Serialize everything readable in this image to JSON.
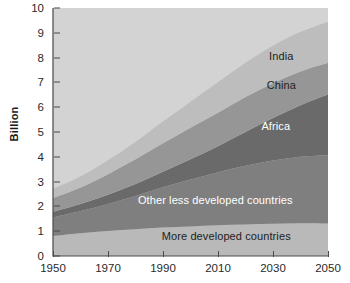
{
  "chart_data": {
    "type": "area",
    "stacked": true,
    "title": "",
    "xlabel": "",
    "ylabel": "Billion",
    "x": [
      1950,
      1960,
      1970,
      1980,
      1990,
      2000,
      2010,
      2020,
      2030,
      2040,
      2050
    ],
    "xlim": [
      1950,
      2050
    ],
    "ylim": [
      0,
      10
    ],
    "xticks": [
      1950,
      1970,
      1990,
      2010,
      2030,
      2050
    ],
    "yticks": [
      0,
      1,
      2,
      3,
      4,
      5,
      6,
      7,
      8,
      9,
      10
    ],
    "grid": false,
    "legend": "inline-labels",
    "series": [
      {
        "name": "More developed countries",
        "color": "#b9b9b9",
        "label_color": "#222222",
        "values": [
          0.81,
          0.92,
          1.01,
          1.08,
          1.15,
          1.19,
          1.24,
          1.27,
          1.3,
          1.32,
          1.31
        ]
      },
      {
        "name": "Other less developed countries",
        "color": "#7f7f7f",
        "label_color": "#ffffff",
        "values": [
          0.74,
          0.89,
          1.09,
          1.34,
          1.62,
          1.89,
          2.14,
          2.37,
          2.55,
          2.68,
          2.75
        ]
      },
      {
        "name": "Africa",
        "color": "#6a6a6a",
        "label_color": "#ffffff",
        "values": [
          0.23,
          0.29,
          0.37,
          0.48,
          0.63,
          0.82,
          1.05,
          1.36,
          1.71,
          2.08,
          2.45
        ]
      },
      {
        "name": "China",
        "color": "#969696",
        "label_color": "#222222",
        "values": [
          0.55,
          0.66,
          0.83,
          1.0,
          1.15,
          1.27,
          1.35,
          1.41,
          1.41,
          1.36,
          1.28
        ]
      },
      {
        "name": "India",
        "color": "#bdbdbd",
        "label_color": "#222222",
        "values": [
          0.38,
          0.45,
          0.56,
          0.7,
          0.87,
          1.05,
          1.23,
          1.38,
          1.51,
          1.6,
          1.66
        ]
      }
    ],
    "totals": [
      2.71,
      3.21,
      3.86,
      4.6,
      5.42,
      6.22,
      7.01,
      7.79,
      8.48,
      9.04,
      9.45
    ],
    "plot_background": "#d3d3d3",
    "series_labels": [
      {
        "text": "India",
        "x_year": 2033,
        "y_value": 8.08,
        "color": "#222222"
      },
      {
        "text": "China",
        "x_year": 2033,
        "y_value": 6.88,
        "color": "#222222"
      },
      {
        "text": "Africa",
        "x_year": 2031,
        "y_value": 5.25,
        "color": "#ffffff"
      },
      {
        "text": "Other less developed countries",
        "x_year": 2009,
        "y_value": 2.25,
        "color": "#ffffff"
      },
      {
        "text": "More developed countries",
        "x_year": 2013,
        "y_value": 0.82,
        "color": "#222222"
      }
    ]
  }
}
